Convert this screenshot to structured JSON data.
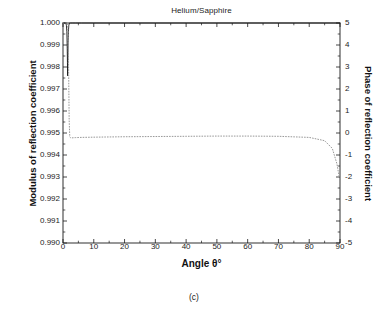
{
  "chart_data": {
    "type": "line",
    "title": "Helium/Sapphire",
    "caption": "(c)",
    "xlabel": "Angle θ°",
    "ylabel_left": "Modulus of reflection coefficient",
    "ylabel_right": "Phase of reflection coefficient",
    "xlim": [
      0,
      90
    ],
    "ylim_left": [
      0.99,
      1.0
    ],
    "ylim_right": [
      -5,
      5
    ],
    "grid": false,
    "legend": null,
    "xticks": [
      0,
      10,
      20,
      30,
      40,
      50,
      60,
      70,
      80,
      90
    ],
    "xtick_labels": [
      "0",
      "10",
      "20",
      "30",
      "40",
      "50",
      "60",
      "70",
      "80",
      "90"
    ],
    "yticks_left": [
      0.99,
      0.991,
      0.992,
      0.993,
      0.994,
      0.995,
      0.996,
      0.997,
      0.998,
      0.999,
      1.0
    ],
    "ytick_labels_left": [
      "0.990",
      "0.991",
      "0.992",
      "0.993",
      "0.994",
      "0.995",
      "0.996",
      "0.997",
      "0.998",
      "0.999",
      "1.000"
    ],
    "yticks_right": [
      -5,
      -4,
      -3,
      -2,
      -1,
      0,
      1,
      2,
      3,
      4,
      5
    ],
    "ytick_labels_right": [
      "-5",
      "-4",
      "-3",
      "-2",
      "-1",
      "0",
      "1",
      "2",
      "3",
      "4",
      "5"
    ],
    "series": [
      {
        "name": "Modulus of reflection coefficient",
        "axis": "left",
        "style": "solid",
        "color": "#1a1a1a",
        "x": [
          0,
          0.3,
          0.6,
          0.9,
          1.1,
          1.25,
          1.35,
          1.45,
          1.5,
          1.55,
          1.65,
          1.75,
          1.9,
          2.1,
          2.4,
          3.0,
          4.0,
          6.0,
          10.0,
          20.0,
          30.0,
          40.0,
          50.0,
          60.0,
          70.0,
          80.0,
          85.0,
          88.0,
          90.0
        ],
        "y": [
          1.0,
          1.0,
          1.0,
          1.0,
          0.9999,
          0.9996,
          0.999,
          0.9982,
          0.9976,
          0.9982,
          0.9991,
          0.9996,
          0.9999,
          1.0,
          1.0,
          1.0,
          1.0,
          1.0,
          1.0,
          1.0,
          1.0,
          1.0,
          1.0,
          1.0,
          1.0,
          1.0,
          1.0,
          1.0,
          1.0
        ]
      },
      {
        "name": "Phase of reflection coefficient",
        "axis": "right",
        "style": "dotted",
        "color": "#999999",
        "x": [
          0,
          0.4,
          0.8,
          1.2,
          1.5,
          1.7,
          1.85,
          2.0,
          2.2,
          2.5,
          3.0,
          4.0,
          6.0,
          10.0,
          20.0,
          30.0,
          40.0,
          50.0,
          60.0,
          70.0,
          80.0,
          85.0,
          87.5,
          89.0,
          90.0
        ],
        "y": [
          5.0,
          5.0,
          5.0,
          5.0,
          5.0,
          4.2,
          2.6,
          0.6,
          -0.18,
          -0.22,
          -0.22,
          -0.21,
          -0.2,
          -0.19,
          -0.17,
          -0.16,
          -0.15,
          -0.14,
          -0.14,
          -0.15,
          -0.2,
          -0.35,
          -0.7,
          -1.4,
          -2.2
        ]
      }
    ],
    "colors": {
      "axis": "#1a1a1a",
      "modulus_curve": "#1a1a1a",
      "phase_curve": "#999999",
      "background": "#ffffff"
    }
  }
}
